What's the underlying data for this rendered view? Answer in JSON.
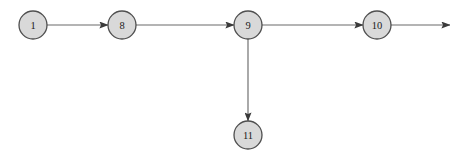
{
  "diagram": {
    "type": "directed-graph",
    "title": "",
    "background_color": "#ffffff",
    "node_fill_color": "#d9d9d9",
    "node_stroke_color": "#4f4f4f",
    "edge_color": "#6b6b6b",
    "label_color": "#1a1a1a",
    "node_radius": 14,
    "nodes": [
      {
        "id": "1",
        "label": "1",
        "cx": 33,
        "cy": 25
      },
      {
        "id": "8",
        "label": "8",
        "cx": 122,
        "cy": 25
      },
      {
        "id": "9",
        "label": "9",
        "cx": 248,
        "cy": 25
      },
      {
        "id": "10",
        "label": "10",
        "cx": 377,
        "cy": 25
      },
      {
        "id": "11",
        "label": "11",
        "cx": 248,
        "cy": 135
      }
    ],
    "edges": [
      {
        "from": "1",
        "to": "8",
        "x1": 47,
        "y1": 25,
        "x2": 108,
        "y2": 25,
        "arrowhead": true,
        "direction": "right"
      },
      {
        "from": "8",
        "to": "9",
        "x1": 136,
        "y1": 25,
        "x2": 234,
        "y2": 25,
        "arrowhead": true,
        "direction": "right"
      },
      {
        "from": "9",
        "to": "10",
        "x1": 262,
        "y1": 25,
        "x2": 363,
        "y2": 25,
        "arrowhead": true,
        "direction": "right"
      },
      {
        "from": "10",
        "to": "",
        "x1": 391,
        "y1": 25,
        "x2": 450,
        "y2": 25,
        "arrowhead": true,
        "direction": "right"
      },
      {
        "from": "9",
        "to": "11",
        "x1": 248,
        "y1": 39,
        "x2": 248,
        "y2": 121,
        "arrowhead": true,
        "direction": "down"
      }
    ]
  }
}
